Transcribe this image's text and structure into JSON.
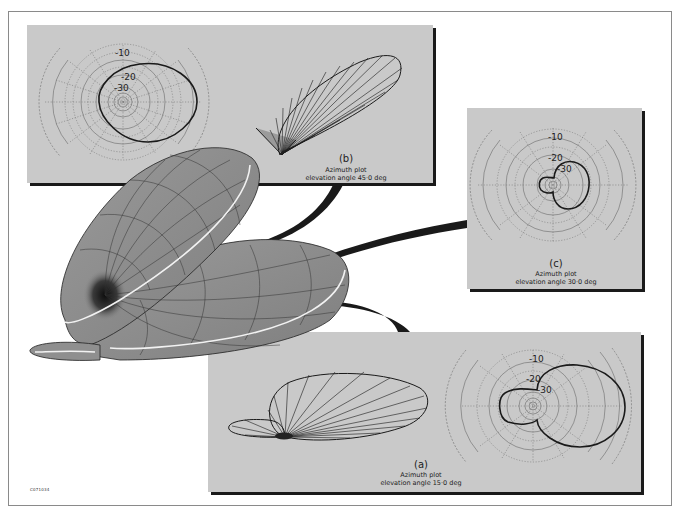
{
  "figure": {
    "code": "C071034",
    "main_graphic": "3D antenna radiation pattern surface with three cut planes"
  },
  "panels": {
    "b": {
      "letter": "(b)",
      "line1": "Azimuth plot",
      "line2": "elevation angle 45·0 deg",
      "ticks": [
        "-10",
        "-20",
        "-30"
      ]
    },
    "c": {
      "letter": "(c)",
      "line1": "Azimuth plot",
      "line2": "elevation angle 30·0 deg",
      "ticks": [
        "-10",
        "-20",
        "-30"
      ]
    },
    "a": {
      "letter": "(a)",
      "line1": "Azimuth plot",
      "line2": "elevation angle 15·0 deg",
      "ticks": [
        "-10",
        "-20",
        "-30"
      ]
    }
  },
  "colors": {
    "panel_bg": "#c9c9c9",
    "panel_shadow": "#1a1a1a",
    "surface": "#8f8f8f",
    "surface_dark": "#2a2a2a",
    "grid": "#666666",
    "trace": "#1a1a1a",
    "highlight": "#f2f2f2"
  }
}
